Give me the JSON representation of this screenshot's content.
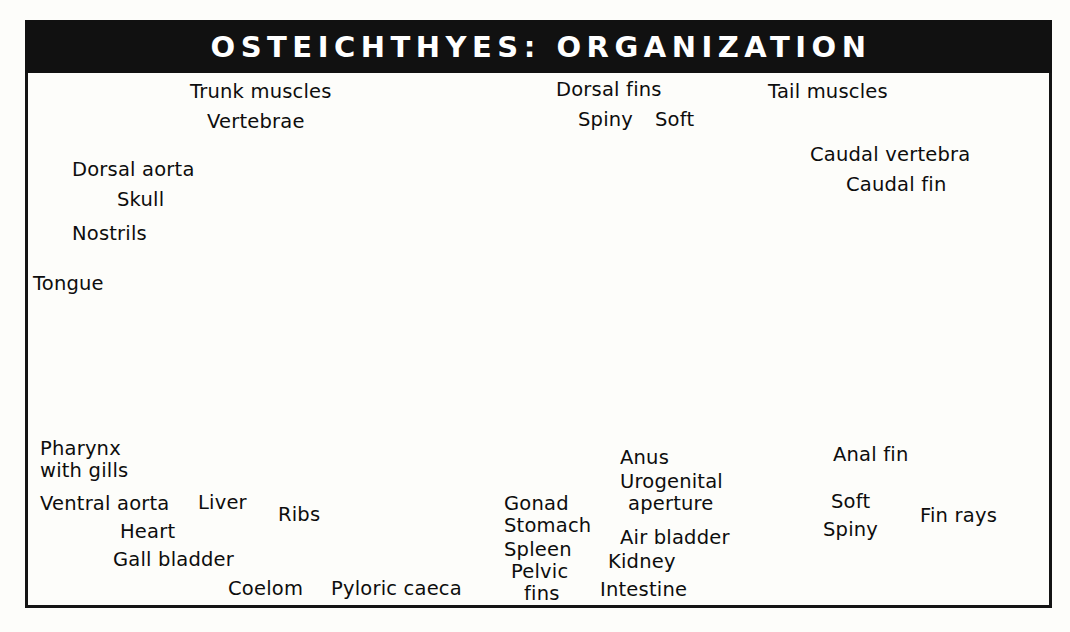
{
  "title": "OSTEICHTHYES:  ORGANIZATION",
  "colors": {
    "title_band": "#111111",
    "title_text": "#ffffff",
    "frame": "#141414",
    "paper": "#fdfdfa",
    "label_text": "#0d0d0d",
    "leader": "#111111"
  },
  "labels": {
    "trunk_muscles": "Trunk muscles",
    "vertebrae": "Vertebrae",
    "dorsal_aorta": "Dorsal aorta",
    "skull": "Skull",
    "nostrils": "Nostrils",
    "tongue": "Tongue",
    "dorsal_fins": "Dorsal fins",
    "spiny": "Spiny",
    "soft": "Soft",
    "tail_muscles": "Tail muscles",
    "caudal_vertebra": "Caudal vertebra",
    "caudal_fin": "Caudal fin",
    "pharynx_line1": "Pharynx",
    "pharynx_line2": "with gills",
    "ventral_aorta": "Ventral aorta",
    "heart": "Heart",
    "gall_bladder": "Gall bladder",
    "liver": "Liver",
    "ribs": "Ribs",
    "coelom": "Coelom",
    "pyloric_caeca": "Pyloric caeca",
    "gonad": "Gonad",
    "stomach": "Stomach",
    "spleen": "Spleen",
    "pelvic_line1": "Pelvic",
    "pelvic_line2": "fins",
    "anus": "Anus",
    "urogenital_line1": "Urogenital",
    "urogenital_line2": "aperture",
    "air_bladder": "Air bladder",
    "kidney": "Kidney",
    "intestine": "Intestine",
    "anal_fin": "Anal fin",
    "fin_soft": "Soft",
    "fin_spiny": "Spiny",
    "fin_rays": "Fin rays"
  }
}
